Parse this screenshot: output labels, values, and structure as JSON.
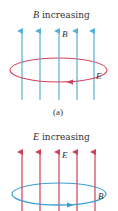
{
  "panel_a": {
    "title_symbol": "B",
    "title_text": " increasing",
    "field_label": "B",
    "loop_label": "E",
    "caption": "(a)",
    "field_color": "#5aaed4",
    "loop_color": "#d0405a",
    "field_lines": 5,
    "loop_arrow_direction": "left"
  },
  "panel_b": {
    "title_symbol": "E",
    "title_text": " increasing",
    "field_label": "E",
    "loop_label": "B",
    "field_color": "#d0405a",
    "loop_color": "#3aa0d0",
    "field_lines": 5,
    "loop_arrow_direction": "right"
  }
}
